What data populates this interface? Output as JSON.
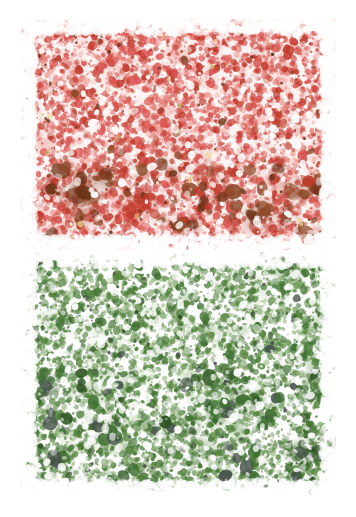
{
  "figure": {
    "width": 356,
    "height": 517,
    "background_color": "#ffffff",
    "panel_count": 2,
    "caption": "",
    "title": ""
  },
  "panels": [
    {
      "name": "top-panel-pink-stain",
      "label": "",
      "stain": "pink-red-eosin",
      "x": 21,
      "y": 19,
      "width": 315,
      "height": 231,
      "background_color": "#ffffff",
      "base_tint": "#fbe9e7",
      "palette": {
        "pale": "#f9dcd8",
        "light": "#f3b4ae",
        "mid": "#e8857d",
        "strong": "#d9534f",
        "deep": "#c0392b",
        "dark": "#8b4a28",
        "darkest": "#6d3418",
        "accent_yellow": "#e8d48a",
        "accent_olive": "#c9b86a"
      },
      "density": 0.86,
      "dark_blob_band": {
        "y_start": 140,
        "y_end": 215,
        "intensity": "high"
      },
      "edge_fade": true
    },
    {
      "name": "bottom-panel-green-stain",
      "label": "",
      "stain": "green",
      "x": 21,
      "y": 252,
      "width": 315,
      "height": 243,
      "background_color": "#ffffff",
      "base_tint": "#ffffff",
      "palette": {
        "pale": "#d7e5cc",
        "light": "#a7c394",
        "mid": "#6f9a5a",
        "strong": "#4f8038",
        "deep": "#3e7030",
        "dark": "#2f5524",
        "darkest": "#45504a",
        "speck": "#4a4a52"
      },
      "density": 0.74,
      "dark_blob_band": {
        "y_start": 120,
        "y_end": 230,
        "intensity": "medium"
      },
      "edge_fade": true
    }
  ],
  "annotations": {
    "scale_bar": null,
    "labels": [],
    "legend": []
  }
}
